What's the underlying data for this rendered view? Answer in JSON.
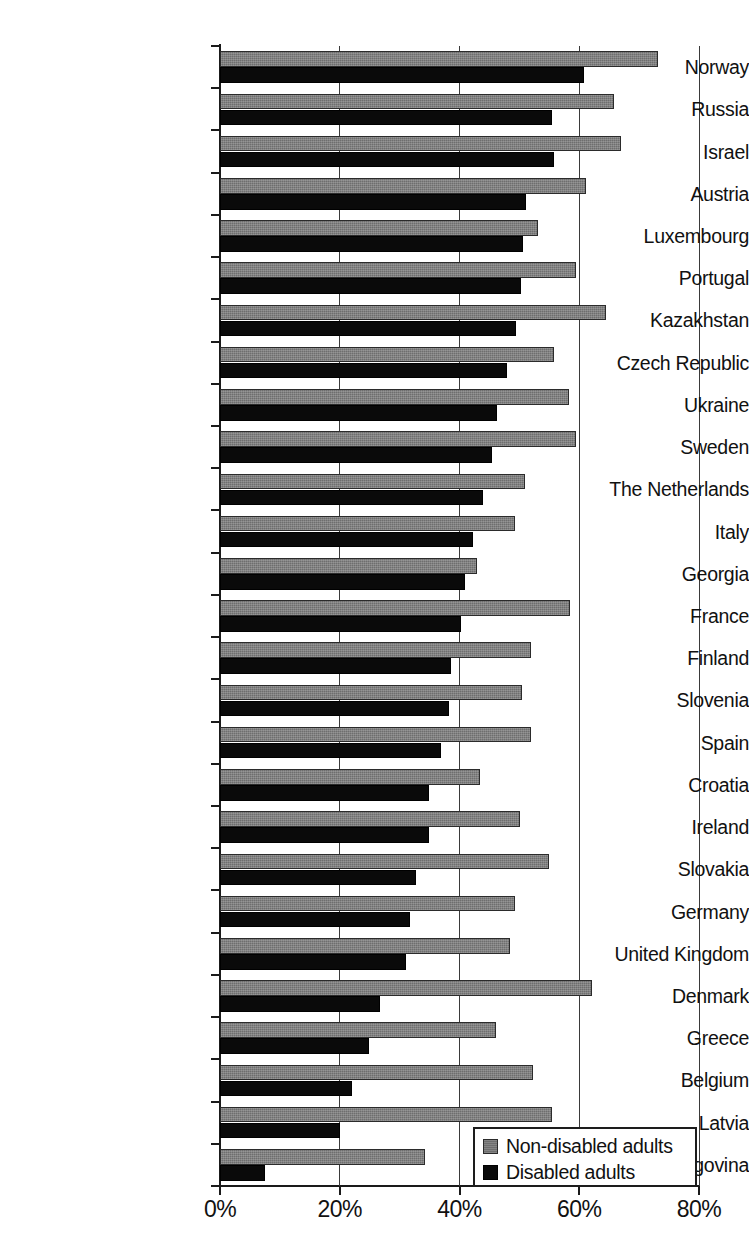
{
  "chart_data": {
    "type": "bar",
    "orientation": "horizontal",
    "title": "",
    "xlabel": "",
    "ylabel": "",
    "xlim": [
      0,
      80
    ],
    "xticks": [
      "0%",
      "20%",
      "40%",
      "60%",
      "80%"
    ],
    "xtick_values": [
      0,
      20,
      40,
      60,
      80
    ],
    "grid": "vertical",
    "legend_position": "bottom-right",
    "categories": [
      "Norway",
      "Russia",
      "Israel",
      "Austria",
      "Luxembourg",
      "Portugal",
      "Kazakhstan",
      "Czech Republic",
      "Ukraine",
      "Sweden",
      "The Netherlands",
      "Italy",
      "Georgia",
      "France",
      "Finland",
      "Slovenia",
      "Spain",
      "Croatia",
      "Ireland",
      "Slovakia",
      "Germany",
      "United Kingdom",
      "Denmark",
      "Greece",
      "Belgium",
      "Latvia",
      "Bosnia & Herzegovina"
    ],
    "series": [
      {
        "name": "Non-disabled adults",
        "color": "#6e6e6e",
        "values": [
          73.2,
          65.8,
          66.9,
          61.1,
          53.1,
          59.4,
          64.4,
          55.7,
          58.3,
          59.5,
          51.0,
          49.2,
          43.0,
          58.5,
          52.0,
          50.4,
          52.0,
          43.5,
          50.1,
          55.0,
          49.2,
          48.5,
          62.2,
          46.1,
          52.3,
          55.4,
          34.2
        ]
      },
      {
        "name": "Disabled adults",
        "color": "#0a0a0a",
        "values": [
          60.8,
          55.4,
          55.7,
          51.1,
          50.6,
          50.2,
          49.5,
          47.9,
          46.2,
          45.5,
          44.0,
          42.2,
          40.9,
          40.2,
          38.5,
          38.3,
          36.9,
          34.9,
          34.9,
          32.7,
          31.7,
          31.1,
          26.7,
          24.9,
          22.1,
          20.1,
          7.5
        ]
      }
    ]
  },
  "legend": {
    "items": [
      {
        "label": "Non-disabled adults",
        "swatch": "gray"
      },
      {
        "label": "Disabled adults",
        "swatch": "black"
      }
    ]
  }
}
